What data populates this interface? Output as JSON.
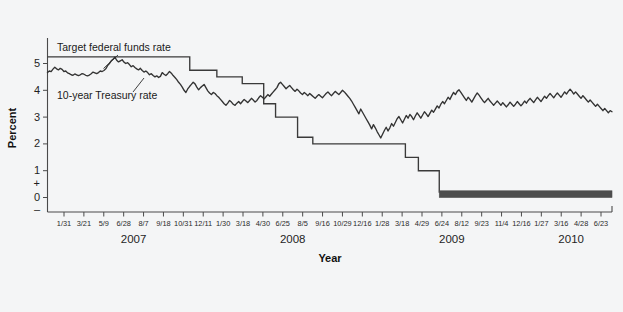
{
  "figure": {
    "background_color": "#f4f5f6",
    "line_color": "#3a3a3a",
    "text_color": "#1f1f1f"
  },
  "annotations": {
    "fed_funds_label": "Target federal funds rate",
    "treasury_label": "10-year Treasury rate"
  },
  "axis": {
    "y_title": "Percent",
    "x_title": "Year",
    "y_ticks": [
      "5",
      "4",
      "3",
      "2",
      "1",
      "+",
      "0",
      "–"
    ],
    "year_groups": [
      "2007",
      "2008",
      "2009",
      "2010"
    ]
  },
  "chart_data": {
    "type": "line",
    "title": "",
    "xlabel": "Year",
    "ylabel": "Percent",
    "ylim": [
      -0.35,
      5.85
    ],
    "grid": false,
    "legend": "inline annotations",
    "y_tick_values": [
      5,
      4,
      3,
      2,
      1,
      0
    ],
    "x_tick_labels": [
      "1/31",
      "3/21",
      "5/9",
      "6/28",
      "8/7",
      "9/18",
      "10/31",
      "12/11",
      "1/30",
      "3/18",
      "4/30",
      "6/25",
      "8/5",
      "9/16",
      "10/29",
      "12/16",
      "1/28",
      "3/18",
      "4/29",
      "6/24",
      "8/12",
      "9/23",
      "11/4",
      "12/16",
      "1/27",
      "3/16",
      "4/28",
      "6/23"
    ],
    "x_year_spans": [
      {
        "year": "2007",
        "first_tick_index": 0,
        "last_tick_index": 7
      },
      {
        "year": "2008",
        "first_tick_index": 8,
        "last_tick_index": 15
      },
      {
        "year": "2009",
        "first_tick_index": 16,
        "last_tick_index": 23
      },
      {
        "year": "2010",
        "first_tick_index": 24,
        "last_tick_index": 27
      }
    ],
    "series": [
      {
        "name": "Target federal funds rate",
        "style": "step",
        "note": "Steps down from 5.25% to a 0-0.25% target band (drawn as thick bar) from Dec 2008 onward",
        "points": [
          {
            "t": 0.0,
            "v": 5.25
          },
          {
            "t": 0.252,
            "v": 5.25
          },
          {
            "t": 0.252,
            "v": 4.75
          },
          {
            "t": 0.3,
            "v": 4.75
          },
          {
            "t": 0.3,
            "v": 4.5
          },
          {
            "t": 0.345,
            "v": 4.5
          },
          {
            "t": 0.345,
            "v": 4.25
          },
          {
            "t": 0.383,
            "v": 4.25
          },
          {
            "t": 0.383,
            "v": 3.5
          },
          {
            "t": 0.404,
            "v": 3.5
          },
          {
            "t": 0.404,
            "v": 3.0
          },
          {
            "t": 0.443,
            "v": 3.0
          },
          {
            "t": 0.443,
            "v": 2.25
          },
          {
            "t": 0.47,
            "v": 2.25
          },
          {
            "t": 0.47,
            "v": 2.0
          },
          {
            "t": 0.634,
            "v": 2.0
          },
          {
            "t": 0.634,
            "v": 1.5
          },
          {
            "t": 0.657,
            "v": 1.5
          },
          {
            "t": 0.657,
            "v": 1.0
          },
          {
            "t": 0.694,
            "v": 1.0
          },
          {
            "t": 0.694,
            "v": 0.175
          },
          {
            "t": 1.0,
            "v": 0.175
          }
        ],
        "band": {
          "from_t": 0.694,
          "to_t": 1.0,
          "low": 0.0,
          "high": 0.25
        }
      },
      {
        "name": "10-year Treasury rate",
        "style": "line",
        "values": [
          4.66,
          4.72,
          4.7,
          4.79,
          4.86,
          4.8,
          4.76,
          4.82,
          4.78,
          4.7,
          4.72,
          4.65,
          4.62,
          4.58,
          4.56,
          4.61,
          4.58,
          4.55,
          4.58,
          4.62,
          4.6,
          4.56,
          4.54,
          4.57,
          4.62,
          4.68,
          4.65,
          4.62,
          4.66,
          4.72,
          4.7,
          4.74,
          4.8,
          4.92,
          5.0,
          5.1,
          5.16,
          5.24,
          5.12,
          5.06,
          5.1,
          5.14,
          5.05,
          5.0,
          5.03,
          4.96,
          4.88,
          4.92,
          4.85,
          4.8,
          4.76,
          4.82,
          4.74,
          4.68,
          4.72,
          4.66,
          4.58,
          4.62,
          4.55,
          4.5,
          4.54,
          4.48,
          4.52,
          4.66,
          4.6,
          4.55,
          4.62,
          4.7,
          4.64,
          4.55,
          4.48,
          4.4,
          4.3,
          4.22,
          4.12,
          4.0,
          3.92,
          4.05,
          4.14,
          4.22,
          4.3,
          4.24,
          4.12,
          4.02,
          4.1,
          4.16,
          4.22,
          4.1,
          3.98,
          3.9,
          3.84,
          3.92,
          3.88,
          3.8,
          3.74,
          3.66,
          3.58,
          3.5,
          3.44,
          3.52,
          3.62,
          3.56,
          3.48,
          3.44,
          3.52,
          3.58,
          3.5,
          3.58,
          3.66,
          3.6,
          3.54,
          3.62,
          3.7,
          3.64,
          3.56,
          3.62,
          3.72,
          3.8,
          3.74,
          3.68,
          3.76,
          3.84,
          3.78,
          3.86,
          3.94,
          4.02,
          4.1,
          4.24,
          4.3,
          4.22,
          4.14,
          4.06,
          4.12,
          4.18,
          4.1,
          4.02,
          3.96,
          4.04,
          3.98,
          3.9,
          3.84,
          3.92,
          3.86,
          3.8,
          3.88,
          3.82,
          3.76,
          3.7,
          3.78,
          3.84,
          3.78,
          3.72,
          3.8,
          3.88,
          3.94,
          3.86,
          3.8,
          3.88,
          3.96,
          3.9,
          3.84,
          3.92,
          4.0,
          3.94,
          3.86,
          3.78,
          3.7,
          3.6,
          3.48,
          3.36,
          3.24,
          3.12,
          3.3,
          3.18,
          3.06,
          2.94,
          2.82,
          2.7,
          2.56,
          2.72,
          2.6,
          2.46,
          2.34,
          2.22,
          2.36,
          2.5,
          2.62,
          2.48,
          2.6,
          2.76,
          2.66,
          2.8,
          2.94,
          3.02,
          2.9,
          2.78,
          2.92,
          3.06,
          2.96,
          3.1,
          3.02,
          2.9,
          3.04,
          3.16,
          3.06,
          2.96,
          3.08,
          3.2,
          3.12,
          3.02,
          3.14,
          3.26,
          3.18,
          3.3,
          3.42,
          3.34,
          3.48,
          3.58,
          3.5,
          3.62,
          3.74,
          3.66,
          3.8,
          3.92,
          3.84,
          3.96,
          4.02,
          3.92,
          3.82,
          3.72,
          3.62,
          3.74,
          3.66,
          3.56,
          3.68,
          3.8,
          3.9,
          3.82,
          3.72,
          3.62,
          3.54,
          3.62,
          3.7,
          3.6,
          3.52,
          3.44,
          3.52,
          3.6,
          3.52,
          3.44,
          3.54,
          3.46,
          3.38,
          3.46,
          3.56,
          3.48,
          3.4,
          3.48,
          3.58,
          3.5,
          3.42,
          3.5,
          3.6,
          3.52,
          3.62,
          3.7,
          3.62,
          3.54,
          3.64,
          3.74,
          3.66,
          3.58,
          3.68,
          3.78,
          3.7,
          3.8,
          3.88,
          3.8,
          3.72,
          3.82,
          3.9,
          3.82,
          3.74,
          3.84,
          3.94,
          3.86,
          3.96,
          4.04,
          3.96,
          3.86,
          3.94,
          3.86,
          3.78,
          3.7,
          3.8,
          3.72,
          3.64,
          3.56,
          3.64,
          3.56,
          3.48,
          3.4,
          3.48,
          3.4,
          3.32,
          3.24,
          3.32,
          3.24,
          3.16,
          3.24,
          3.2
        ]
      }
    ]
  }
}
